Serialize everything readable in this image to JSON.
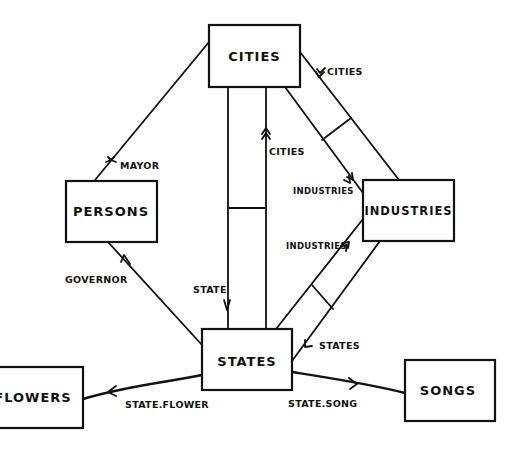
{
  "diagram": {
    "type": "entity-relationship",
    "entities": [
      {
        "id": "cities",
        "label": "CITIES"
      },
      {
        "id": "persons",
        "label": "PERSONS"
      },
      {
        "id": "industries",
        "label": "INDUSTRIES"
      },
      {
        "id": "states",
        "label": "STATES"
      },
      {
        "id": "flowers",
        "label": "FLOWERS"
      },
      {
        "id": "songs",
        "label": "SONGS"
      }
    ],
    "relationships": [
      {
        "from": "cities",
        "to": "persons",
        "label": "MAYOR"
      },
      {
        "from": "states",
        "to": "persons",
        "label": "GOVERNOR"
      },
      {
        "from": "cities",
        "to": "states",
        "label": "STATE"
      },
      {
        "from": "states",
        "to": "cities",
        "label": "CITIES"
      },
      {
        "from": "industries",
        "to": "cities",
        "label": "CITIES"
      },
      {
        "from": "cities",
        "to": "industries",
        "label": "INDUSTRIES"
      },
      {
        "from": "states",
        "to": "industries",
        "label": "INDUSTRIES"
      },
      {
        "from": "industries",
        "to": "states",
        "label": "STATES"
      },
      {
        "from": "states",
        "to": "flowers",
        "label": "STATE.FLOWER"
      },
      {
        "from": "states",
        "to": "songs",
        "label": "STATE.SONG"
      }
    ]
  }
}
